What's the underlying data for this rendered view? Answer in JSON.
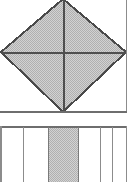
{
  "figure": {
    "canvas": {
      "width": 132,
      "height": 182,
      "background": "#ffffff"
    },
    "colors": {
      "stroke": "#4a4a4a",
      "stroke_light": "#8c8c8c",
      "fill_shaded": "#c8c8c8",
      "fill_plain": "#ffffff",
      "dither_dot": "#b4b4b4"
    },
    "panels": [
      {
        "name": "upper-panel",
        "label": "square-with-diamond",
        "x": 1,
        "y": 0,
        "width": 126,
        "height": 112,
        "fill": "#ffffff",
        "border_sides": "right,bottom",
        "note": "Top of panel is cropped at the image edge"
      },
      {
        "name": "lower-panel",
        "label": "strip-band",
        "x": 1,
        "y": 126,
        "width": 126,
        "height": 56,
        "fill": "#ffffff",
        "border_sides": "left,right,top",
        "note": "Bottom of band is cropped at the image edge"
      }
    ],
    "diamond": {
      "name": "inscribed-diamond",
      "fill": "#c8c8c8",
      "shaded": true,
      "vertices": [
        {
          "label": "top",
          "x": 63,
          "y": -1
        },
        {
          "label": "right",
          "x": 126,
          "y": 52
        },
        {
          "label": "bottom",
          "x": 63,
          "y": 112
        },
        {
          "label": "left",
          "x": 1,
          "y": 52
        }
      ],
      "diagonals": [
        {
          "label": "vertical-diagonal",
          "x1": 63,
          "y1": 0,
          "x2": 63,
          "y2": 112
        },
        {
          "label": "horizontal-diagonal",
          "x1": 1,
          "y1": 52,
          "x2": 126,
          "y2": 52
        }
      ]
    },
    "strips": [
      {
        "index": 0,
        "x": 1,
        "width": 22,
        "fill": "#ffffff",
        "shaded": false
      },
      {
        "index": 1,
        "x": 23,
        "width": 25,
        "fill": "#ffffff",
        "shaded": false
      },
      {
        "index": 2,
        "x": 48,
        "width": 30,
        "fill": "#c8c8c8",
        "shaded": true
      },
      {
        "index": 3,
        "x": 78,
        "width": 22,
        "fill": "#ffffff",
        "shaded": false
      },
      {
        "index": 4,
        "x": 100,
        "width": 12,
        "fill": "#ffffff",
        "shaded": false
      },
      {
        "index": 5,
        "x": 112,
        "width": 15,
        "fill": "#ffffff",
        "shaded": false
      }
    ],
    "strip_dividers": [
      {
        "x": 23
      },
      {
        "x": 48
      },
      {
        "x": 78
      },
      {
        "x": 100
      },
      {
        "x": 112
      }
    ]
  }
}
